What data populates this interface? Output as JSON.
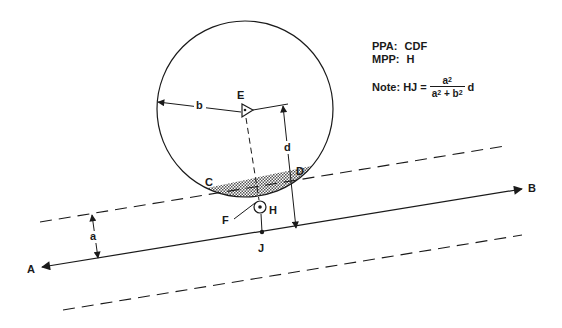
{
  "diagram": {
    "points": {
      "A": "A",
      "B": "B",
      "C": "C",
      "D": "D",
      "E": "E",
      "F": "F",
      "H": "H",
      "J": "J"
    },
    "dimensions": {
      "a": "a",
      "b": "b",
      "d": "d"
    },
    "notes": {
      "ppa_label": "PPA:",
      "ppa_value": "CDF",
      "mpp_label": "MPP:",
      "mpp_value": "H",
      "note_label": "Note: HJ =",
      "numerator_base": "a",
      "numerator_exp": "2",
      "denominator_a": "a",
      "denominator_a_exp": "2",
      "denominator_plus": " + ",
      "denominator_b": "b",
      "denominator_b_exp": "2",
      "multiplier": "d"
    },
    "colors": {
      "ink": "#1a1a1a",
      "background": "#ffffff"
    }
  }
}
